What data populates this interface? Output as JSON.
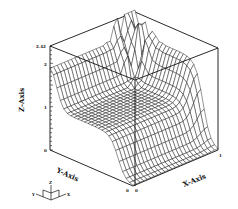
{
  "chart_data": {
    "type": "surface3d",
    "title": "",
    "xlabel": "X-Axis",
    "ylabel": "Y-Axis",
    "zlabel": "Z-Axis",
    "xlim": [
      0,
      1
    ],
    "ylim": [
      0,
      1
    ],
    "zlim": [
      0,
      2.42
    ],
    "x_ticks": [
      "0",
      "1"
    ],
    "y_ticks": [
      "0",
      "1"
    ],
    "z_ticks": [
      "0",
      "1",
      "2",
      "2.42"
    ],
    "z_max_label": "2.42",
    "grid_size": 24,
    "features": {
      "plateau_level": 1.0,
      "rim_height": 1.9,
      "spike_peak": 2.42,
      "ramp_edge": "y=0 side"
    }
  },
  "axes": {
    "z_axis_label": "Z-Axis",
    "x_axis_label": "X-Axis",
    "y_axis_label": "Y-Axis",
    "z_tick_top": "2.42",
    "z_tick_2": "2",
    "z_tick_1": "1",
    "z_tick_0": "0",
    "x_tick_end": "1",
    "origin_tick_a": "0",
    "origin_tick_b": "0"
  },
  "triad": {
    "x": "X",
    "y": "Y",
    "z": "Z"
  }
}
